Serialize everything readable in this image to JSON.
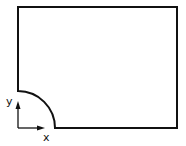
{
  "diagram": {
    "axes": {
      "x_label": "x",
      "y_label": "y"
    },
    "colors": {
      "stroke": "#111111",
      "background": "#ffffff"
    }
  }
}
